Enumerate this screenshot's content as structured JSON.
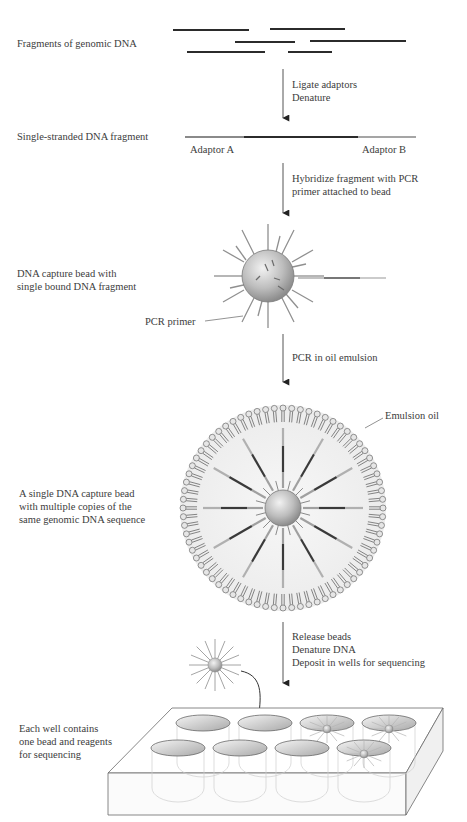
{
  "steps": [
    {
      "label": "Fragments of genomic DNA"
    },
    {
      "label": "Single-stranded DNA fragment",
      "adaptor_a": "Adaptor A",
      "adaptor_b": "Adaptor B"
    },
    {
      "label_lines": [
        "DNA capture bead with",
        "single bound DNA fragment"
      ],
      "callout": "PCR primer"
    },
    {
      "label_lines": [
        "A single DNA capture bead",
        "with multiple copies of the",
        "same genomic DNA sequence"
      ],
      "callout": "Emulsion oil"
    },
    {
      "label_lines": [
        "Each well contains",
        "one bead and reagents",
        "for sequencing"
      ]
    }
  ],
  "arrows": [
    {
      "lines": [
        "Ligate adaptors",
        "Denature"
      ]
    },
    {
      "lines": [
        "Hybridize fragment with PCR",
        "primer attached to bead"
      ]
    },
    {
      "lines": [
        "PCR in oil emulsion"
      ]
    },
    {
      "lines": [
        "Release beads",
        "Denature DNA",
        "Deposit in wells for sequencing"
      ]
    }
  ],
  "colors": {
    "text": "#3c3c3c",
    "dna": "#2b2b2b",
    "adaptor": "#8a8a8a",
    "bead": "#b8b8b8",
    "arrow": "#555555"
  }
}
